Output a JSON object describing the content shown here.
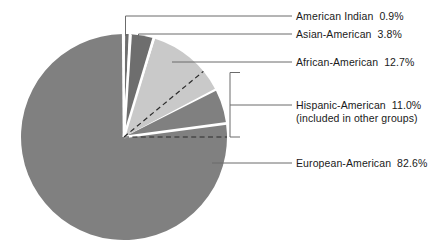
{
  "chart_data": {
    "type": "pie",
    "title": "",
    "subtitle": "",
    "xlabel": "",
    "ylabel": "",
    "legend_position": "right-callouts",
    "grid": false,
    "units": "percent",
    "categories": [
      "American Indian",
      "Asian-American",
      "African-American",
      "European-American"
    ],
    "values": [
      0.9,
      3.8,
      12.7,
      82.6
    ],
    "value_labels": [
      "0.9%",
      "3.8%",
      "12.7%",
      "82.6%"
    ],
    "slice_colors": [
      "#6e6e6e",
      "#6e6e6e",
      "#c9c9c9",
      "#808080"
    ],
    "start_angle_deg": 0,
    "direction": "clockwise",
    "overlay": {
      "name": "Hispanic-American",
      "value": 11.0,
      "value_label": "11.0%",
      "note": "(included in other groups)",
      "style": "dashed-bracket"
    },
    "annotations": [
      "Hispanic-American 11.0% is included in other groups and is marked by a dashed sector overlay."
    ]
  },
  "labels": {
    "american_indian": {
      "name": "American Indian",
      "value": "0.9%"
    },
    "asian_american": {
      "name": "Asian-American",
      "value": "3.8%"
    },
    "african_american": {
      "name": "African-American",
      "value": "12.7%"
    },
    "hispanic_american": {
      "name": "Hispanic-American",
      "value": "11.0%",
      "note": "(included in other groups)"
    },
    "european_american": {
      "name": "European-American",
      "value": "82.6%"
    }
  },
  "colors": {
    "european_american_slice": "#808080",
    "african_american_slice": "#c9c9c9",
    "asian_american_slice": "#6e6e6e",
    "american_indian_slice": "#6e6e6e",
    "leader_line": "#6b6b6b",
    "dashed_line": "#2b2b2b",
    "text": "#1a1a1a",
    "background": "#ffffff"
  }
}
